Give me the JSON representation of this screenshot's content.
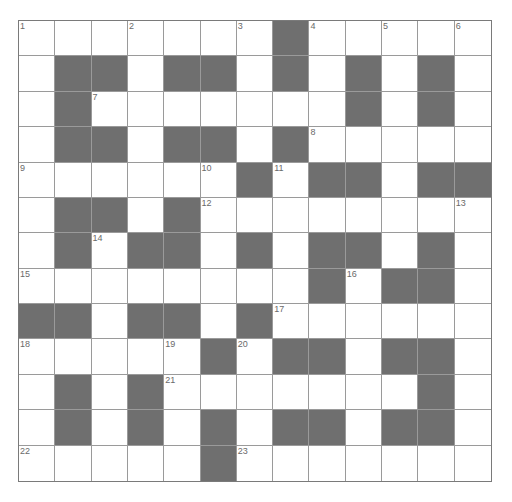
{
  "puzzle": {
    "rows": 13,
    "cols": 13,
    "colors": {
      "block": "#6f6f6f",
      "cell": "#ffffff",
      "line": "#9a9a9a",
      "number": "#6a6a6a"
    },
    "grid": [
      "WWWWWWWBWWWWW",
      "WBBWBBWBWBWBW",
      "WBWWWWWWWBWBW",
      "WBBWBBWBWWWWW",
      "WWWWWWBWBBWBB",
      "WBBWBWWWWWWWW",
      "WBWBBWBWBBWBW",
      "WWWWWWWWBWBBW",
      "BBWBBWBWWWWWW",
      "WWWWWBWBBWBBW",
      "WBWBWWWWWWWBW",
      "WBWBWBWBBWBBW",
      "WWWWWBWWWWWWW"
    ],
    "numbers": [
      {
        "n": "1",
        "r": 0,
        "c": 0
      },
      {
        "n": "2",
        "r": 0,
        "c": 3
      },
      {
        "n": "3",
        "r": 0,
        "c": 6
      },
      {
        "n": "4",
        "r": 0,
        "c": 8
      },
      {
        "n": "5",
        "r": 0,
        "c": 10
      },
      {
        "n": "6",
        "r": 0,
        "c": 12
      },
      {
        "n": "7",
        "r": 2,
        "c": 2
      },
      {
        "n": "8",
        "r": 3,
        "c": 8
      },
      {
        "n": "9",
        "r": 4,
        "c": 0
      },
      {
        "n": "10",
        "r": 4,
        "c": 5
      },
      {
        "n": "11",
        "r": 4,
        "c": 7
      },
      {
        "n": "12",
        "r": 5,
        "c": 5
      },
      {
        "n": "13",
        "r": 5,
        "c": 12
      },
      {
        "n": "14",
        "r": 6,
        "c": 2
      },
      {
        "n": "15",
        "r": 7,
        "c": 0
      },
      {
        "n": "16",
        "r": 7,
        "c": 9
      },
      {
        "n": "17",
        "r": 8,
        "c": 7
      },
      {
        "n": "18",
        "r": 9,
        "c": 0
      },
      {
        "n": "19",
        "r": 9,
        "c": 4
      },
      {
        "n": "20",
        "r": 9,
        "c": 6
      },
      {
        "n": "21",
        "r": 10,
        "c": 4
      },
      {
        "n": "22",
        "r": 12,
        "c": 0
      },
      {
        "n": "23",
        "r": 12,
        "c": 6
      }
    ]
  }
}
